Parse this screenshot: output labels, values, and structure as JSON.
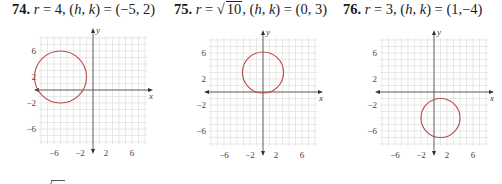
{
  "problems": [
    {
      "number": "74.",
      "r_label": "r",
      "r_value": "4",
      "r_sqrt": false,
      "center_text": "(−5, 2)",
      "hk_label": "(h, k)",
      "center": [
        -5,
        2
      ],
      "radius": 4,
      "offset_x": 0,
      "title_left": 12,
      "origin_px": [
        93,
        90
      ]
    },
    {
      "number": "75.",
      "r_label": "r",
      "r_value": "10",
      "r_sqrt": true,
      "center_text": "(0, 3)",
      "hk_label": "(h, k)",
      "center": [
        0,
        3
      ],
      "radius": 3.1623,
      "offset_x": 0,
      "title_left": 174,
      "origin_px": [
        263,
        92
      ]
    },
    {
      "number": "76.",
      "r_label": "r",
      "r_value": "3",
      "r_sqrt": false,
      "center_text": "(1,−4)",
      "hk_label": "(h, k)",
      "center": [
        1,
        -4
      ],
      "radius": 3,
      "offset_x": 0,
      "title_left": 343,
      "origin_px": [
        434,
        92
      ]
    }
  ],
  "axes": {
    "x_label": "x",
    "y_label": "y",
    "range": [
      -8,
      8
    ],
    "unit_px": 6.5,
    "x_ticks": [
      {
        "v": -6,
        "label": "−6"
      },
      {
        "v": -2,
        "label": "−2"
      },
      {
        "v": 2,
        "label": "2"
      },
      {
        "v": 6,
        "label": "6"
      }
    ],
    "y_ticks": [
      {
        "v": 6,
        "label": "6"
      },
      {
        "v": 2,
        "label": "2"
      },
      {
        "v": -2,
        "label": "−2"
      },
      {
        "v": -6,
        "label": "−6"
      }
    ]
  },
  "colors": {
    "circle": "#b94a48",
    "grid": "#dedede",
    "axis": "#555555"
  },
  "chart_data": [
    {
      "type": "scatter",
      "title": "74. r = 4, (h, k) = (−5, 2)",
      "xlabel": "x",
      "ylabel": "y",
      "xlim": [
        -8,
        8
      ],
      "ylim": [
        -8,
        8
      ],
      "grid": true,
      "x_ticks": [
        -6,
        -2,
        2,
        6
      ],
      "y_ticks": [
        6,
        2,
        -2,
        -6
      ],
      "series": [
        {
          "name": "circle",
          "shape": "circle",
          "center": [
            -5,
            2
          ],
          "radius": 4
        }
      ]
    },
    {
      "type": "scatter",
      "title": "75. r = √10, (h, k) = (0, 3)",
      "xlabel": "x",
      "ylabel": "y",
      "xlim": [
        -8,
        8
      ],
      "ylim": [
        -8,
        8
      ],
      "grid": true,
      "x_ticks": [
        -6,
        -2,
        2,
        6
      ],
      "y_ticks": [
        6,
        2,
        -2,
        -6
      ],
      "series": [
        {
          "name": "circle",
          "shape": "circle",
          "center": [
            0,
            3
          ],
          "radius": 3.1623
        }
      ]
    },
    {
      "type": "scatter",
      "title": "76. r = 3, (h, k) = (1, −4)",
      "xlabel": "x",
      "ylabel": "y",
      "xlim": [
        -8,
        8
      ],
      "ylim": [
        -8,
        8
      ],
      "grid": true,
      "x_ticks": [
        -6,
        -2,
        2,
        6
      ],
      "y_ticks": [
        6,
        2,
        -2,
        -6
      ],
      "series": [
        {
          "name": "circle",
          "shape": "circle",
          "center": [
            1,
            -4
          ],
          "radius": 3
        }
      ]
    }
  ]
}
